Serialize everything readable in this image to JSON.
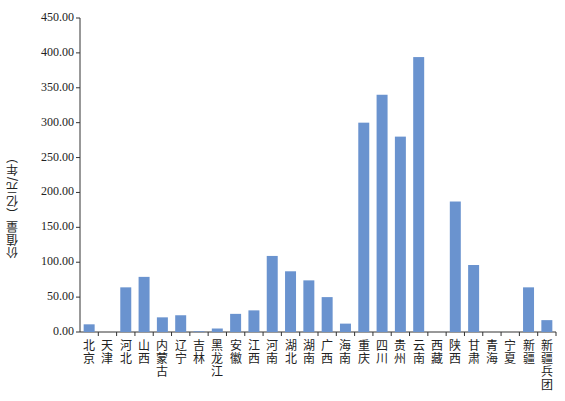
{
  "chart_data": {
    "type": "bar",
    "title": "",
    "xlabel": "",
    "ylabel": "价值量（亿元/年）",
    "ylim": [
      0,
      450
    ],
    "yticks": [
      "0.00",
      "50.00",
      "100.00",
      "150.00",
      "200.00",
      "250.00",
      "300.00",
      "350.00",
      "400.00",
      "450.00"
    ],
    "grid": false,
    "legend": null,
    "bar_color": "#6a93cf",
    "categories": [
      "北京",
      "天津",
      "河北",
      "山西",
      "内蒙古",
      "辽宁",
      "吉林",
      "黑龙江",
      "安徽",
      "江西",
      "河南",
      "湖北",
      "湖南",
      "广西",
      "海南",
      "重庆",
      "四川",
      "贵州",
      "云南",
      "西藏",
      "陕西",
      "甘肃",
      "青海",
      "宁夏",
      "新疆",
      "新疆兵团"
    ],
    "values": [
      11,
      0,
      64,
      79,
      21,
      24,
      1,
      5,
      26,
      31,
      109,
      87,
      74,
      50,
      12,
      300,
      340,
      280,
      394,
      0,
      187,
      96,
      0,
      0,
      64,
      17
    ]
  }
}
